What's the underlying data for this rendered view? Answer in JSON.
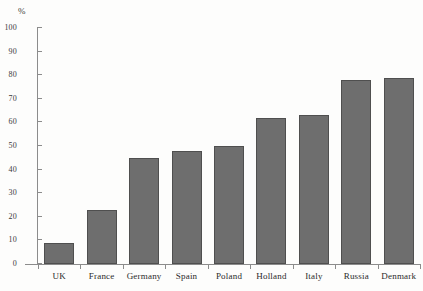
{
  "chart_data": {
    "type": "bar",
    "title": "",
    "subtitle": "",
    "xlabel": "",
    "ylabel": "%",
    "unit_label": "%",
    "categories": [
      "UK",
      "France",
      "Germany",
      "Spain",
      "Poland",
      "Holland",
      "Italy",
      "Russia",
      "Denmark"
    ],
    "values": [
      9,
      23,
      45,
      48,
      50,
      62,
      63,
      78,
      79
    ],
    "series": [
      {
        "name": "",
        "values": [
          9,
          23,
          45,
          48,
          50,
          62,
          63,
          78,
          79
        ]
      }
    ],
    "ylim": [
      0,
      100
    ],
    "y_ticks": [
      0,
      10,
      20,
      30,
      40,
      50,
      60,
      70,
      80,
      90,
      100
    ],
    "y_tick_labels": [
      "0",
      "10",
      "20",
      "30",
      "40",
      "50",
      "60",
      "70",
      "80",
      "90",
      "100"
    ],
    "grid": false,
    "legend": false,
    "legend_position": "none",
    "annotations": [],
    "colors": {
      "bar_fill": "#6e6e6e",
      "bar_stroke": "#4f4f4f",
      "axis": "#8c8c8c",
      "text": "#2b2b2b",
      "background": "#fdfdfc"
    }
  }
}
